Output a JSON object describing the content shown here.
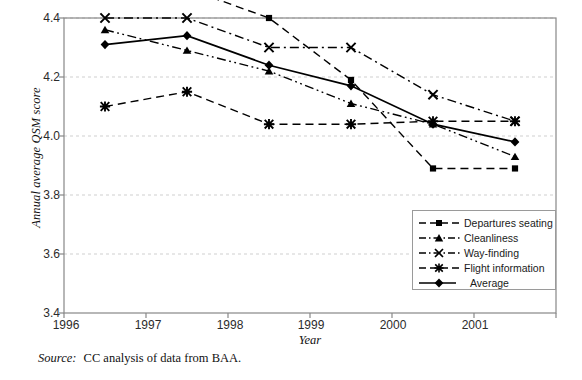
{
  "chart_data": {
    "type": "line",
    "title": "",
    "xlabel": "Year",
    "ylabel": "Annual average QSM score",
    "categories": [
      "1996",
      "1997",
      "1998",
      "1999",
      "2000",
      "2001"
    ],
    "ylim": [
      3.4,
      4.4
    ],
    "yticks": [
      "3.4",
      "3.6",
      "3.8",
      "4.0",
      "4.2",
      "4.4"
    ],
    "ytick_values": [
      3.4,
      3.6,
      3.8,
      4.0,
      4.2,
      4.4
    ],
    "grid": "horizontal dashed light-grey",
    "legend_position": "inside lower-right",
    "series": [
      {
        "name": "Departures seating",
        "marker": "square",
        "dash": "dashed",
        "values": [
          null,
          4.5,
          4.4,
          4.19,
          3.89,
          3.89
        ]
      },
      {
        "name": "Cleanliness",
        "marker": "triangle",
        "dash": "dash-dot-dot",
        "values": [
          4.36,
          4.29,
          4.22,
          4.11,
          4.04,
          3.93
        ]
      },
      {
        "name": "Way-finding",
        "marker": "cross",
        "dash": "dash-dot",
        "values": [
          4.4,
          4.4,
          4.3,
          4.3,
          4.14,
          4.05
        ]
      },
      {
        "name": "Flight information",
        "marker": "asterisk",
        "dash": "dashed",
        "values": [
          4.1,
          4.15,
          4.04,
          4.04,
          4.05,
          4.05
        ]
      },
      {
        "name": "Average",
        "marker": "diamond",
        "dash": "solid",
        "values": [
          4.31,
          4.34,
          4.24,
          4.17,
          4.04,
          3.98
        ]
      }
    ],
    "annotations": {
      "source_label": "Source:",
      "source_text": "CC analysis of data from BAA."
    },
    "colors": {
      "line": "#000000",
      "grid": "#cfcfcf",
      "axis": "#888888",
      "text": "#1a1a1a",
      "background": "#ffffff"
    }
  }
}
